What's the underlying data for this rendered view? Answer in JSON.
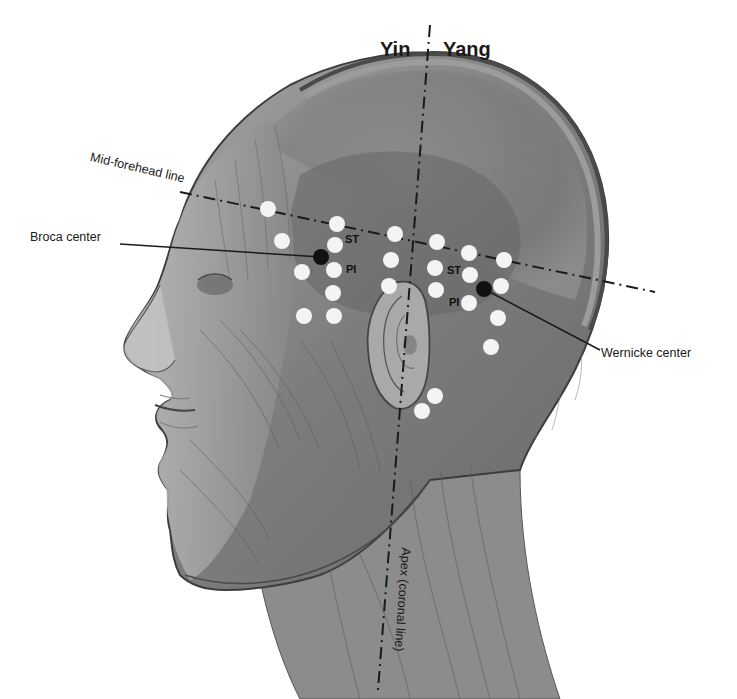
{
  "diagram": {
    "title_left": "Yin",
    "title_right": "Yang",
    "lines": {
      "mid_forehead": "Mid-forehead line",
      "apex": "Apex (coronal line)"
    },
    "centers": {
      "broca": "Broca center",
      "wernicke": "Wernicke center"
    },
    "point_labels": {
      "st_left": "ST",
      "pi_left": "PI",
      "st_right": "ST",
      "pi_right": "PI"
    },
    "colors": {
      "skin_dark": "#5e5e5e",
      "skin_mid": "#8a8a8a",
      "skin_light": "#b4b4b4",
      "point_white": "#f4f4f4",
      "center_black": "#111111",
      "line": "#1a1a1a"
    },
    "points_white": [
      [
        268,
        209
      ],
      [
        337,
        224
      ],
      [
        282,
        241
      ],
      [
        335,
        245
      ],
      [
        302,
        272
      ],
      [
        334,
        270
      ],
      [
        333,
        293
      ],
      [
        304,
        316
      ],
      [
        334,
        316
      ],
      [
        395,
        234
      ],
      [
        437,
        242
      ],
      [
        469,
        253
      ],
      [
        504,
        260
      ],
      [
        391,
        260
      ],
      [
        435,
        268
      ],
      [
        470,
        275
      ],
      [
        501,
        286
      ],
      [
        389,
        286
      ],
      [
        436,
        290
      ],
      [
        469,
        303
      ],
      [
        498,
        318
      ],
      [
        491,
        347
      ],
      [
        435,
        396
      ],
      [
        422,
        411
      ]
    ],
    "points_black": [
      {
        "name": "broca",
        "x": 321,
        "y": 257
      },
      {
        "name": "wernicke",
        "x": 484,
        "y": 289
      }
    ]
  }
}
